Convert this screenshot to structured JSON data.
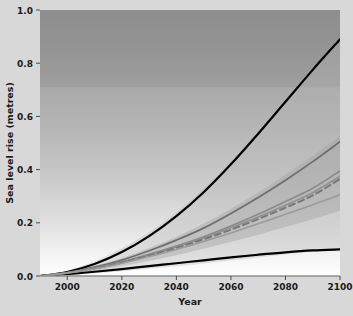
{
  "chart_data": {
    "type": "line",
    "title": "",
    "xlabel": "Year",
    "ylabel": "Sea level rise (metres)",
    "xlim": [
      1990,
      2100
    ],
    "ylim": [
      0.0,
      1.0
    ],
    "grid": false,
    "legend": "none",
    "x_ticks": [
      2000,
      2020,
      2040,
      2060,
      2080,
      2100
    ],
    "x_tick_labels": [
      "2000",
      "2020",
      "2040",
      "2060",
      "2080",
      "2100"
    ],
    "y_ticks": [
      0.0,
      0.2,
      0.4,
      0.6,
      0.8,
      1.0
    ],
    "y_tick_labels": [
      "0.0",
      "0.2",
      "0.4",
      "0.6",
      "0.8",
      "1.0"
    ],
    "background": {
      "description": "vertical grey-to-white gradient panel",
      "top_color": "#909090",
      "bottom_color": "#ffffff",
      "band_break_value": 0.71
    },
    "x": [
      1990,
      2000,
      2010,
      2020,
      2030,
      2040,
      2050,
      2060,
      2070,
      2080,
      2090,
      2100
    ],
    "series": [
      {
        "name": "upper-bound-black",
        "color": "#000000",
        "style": "solid",
        "width": 2.2,
        "values": [
          0.0,
          0.015,
          0.045,
          0.09,
          0.15,
          0.225,
          0.315,
          0.42,
          0.535,
          0.655,
          0.775,
          0.89
        ]
      },
      {
        "name": "lower-bound-black",
        "color": "#000000",
        "style": "solid",
        "width": 2.2,
        "values": [
          0.0,
          0.007,
          0.016,
          0.026,
          0.037,
          0.048,
          0.059,
          0.07,
          0.08,
          0.089,
          0.096,
          0.1
        ]
      },
      {
        "name": "scenario-a1fi-dark-grey",
        "color": "#6e6e6e",
        "style": "solid",
        "width": 1.8,
        "values": [
          0.0,
          0.013,
          0.033,
          0.06,
          0.095,
          0.135,
          0.18,
          0.235,
          0.295,
          0.36,
          0.43,
          0.505
        ]
      },
      {
        "name": "scenario-a2-grey",
        "color": "#8a8a8a",
        "style": "solid",
        "width": 1.6,
        "values": [
          0.0,
          0.012,
          0.03,
          0.053,
          0.082,
          0.113,
          0.148,
          0.188,
          0.232,
          0.28,
          0.33,
          0.395
        ]
      },
      {
        "name": "scenario-a1b-grey",
        "color": "#909090",
        "style": "solid",
        "width": 1.6,
        "values": [
          0.0,
          0.012,
          0.029,
          0.051,
          0.079,
          0.109,
          0.143,
          0.181,
          0.222,
          0.266,
          0.313,
          0.375
        ]
      },
      {
        "name": "scenario-mean-dashed",
        "color": "#777777",
        "style": "dashed",
        "width": 2.0,
        "values": [
          0.0,
          0.011,
          0.028,
          0.05,
          0.077,
          0.106,
          0.138,
          0.174,
          0.214,
          0.257,
          0.303,
          0.365
        ]
      },
      {
        "name": "scenario-b1-light-grey",
        "color": "#9a9a9a",
        "style": "solid",
        "width": 1.6,
        "values": [
          0.0,
          0.011,
          0.027,
          0.048,
          0.073,
          0.1,
          0.13,
          0.162,
          0.196,
          0.232,
          0.268,
          0.305
        ]
      }
    ],
    "bands": [
      {
        "name": "outer-uncertainty-band",
        "color": "#b4b4b4",
        "opacity": 0.35,
        "upper": [
          0.0,
          0.02,
          0.055,
          0.105,
          0.165,
          0.24,
          0.33,
          0.43,
          0.545,
          0.665,
          0.78,
          0.9
        ],
        "lower": [
          0.0,
          0.004,
          0.01,
          0.018,
          0.027,
          0.037,
          0.047,
          0.058,
          0.07,
          0.081,
          0.092,
          0.1
        ]
      },
      {
        "name": "inner-uncertainty-band",
        "color": "#a0a0a0",
        "opacity": 0.4,
        "upper": [
          0.0,
          0.015,
          0.038,
          0.068,
          0.105,
          0.148,
          0.197,
          0.253,
          0.315,
          0.382,
          0.452,
          0.525
        ],
        "lower": [
          0.0,
          0.008,
          0.02,
          0.037,
          0.056,
          0.078,
          0.102,
          0.128,
          0.155,
          0.184,
          0.213,
          0.245
        ]
      }
    ]
  },
  "axis": {
    "x_title": "Year",
    "y_title": "Sea level rise (metres)"
  }
}
